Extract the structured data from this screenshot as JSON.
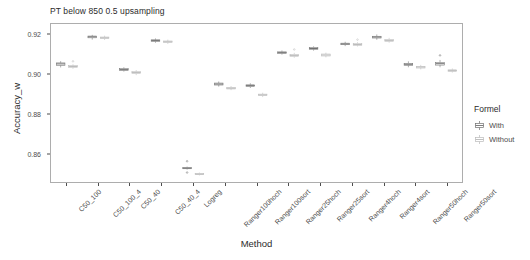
{
  "chart_data": {
    "type": "box",
    "title": "PT below 850 0.5 upsampling",
    "xlabel": "Method",
    "ylabel": "Accuracy_w",
    "ylim": [
      0.8455,
      0.9255
    ],
    "yticks": [
      0.86,
      0.88,
      0.9,
      0.92
    ],
    "ytick_labels": [
      "0.86",
      "0.88",
      "0.90",
      "0.92"
    ],
    "grid": false,
    "legend": {
      "title": "Formel",
      "position": "right",
      "entries": [
        {
          "label": "With",
          "color": "#6f6f6f"
        },
        {
          "label": "Without",
          "color": "#b9b9b9"
        }
      ]
    },
    "categories": [
      "C50_100",
      "C50_100_4",
      "C50_40",
      "C50_40_4",
      "Logreg",
      "Ranger100hoch",
      "Ranger100sort",
      "Ranger25hoch",
      "Ranger25sort",
      "Ranger4hoch",
      "Ranger4sort",
      "Ranger50hoch",
      "Ranger50sort"
    ],
    "series": [
      {
        "name": "With",
        "boxes": [
          {
            "min": 0.9035,
            "q1": 0.9046,
            "median": 0.9053,
            "q3": 0.9058,
            "max": 0.9067,
            "outliers": []
          },
          {
            "min": 0.9176,
            "q1": 0.9185,
            "median": 0.919,
            "q3": 0.9194,
            "max": 0.92,
            "outliers": []
          },
          {
            "min": 0.9014,
            "q1": 0.902,
            "median": 0.9024,
            "q3": 0.9029,
            "max": 0.9036,
            "outliers": []
          },
          {
            "min": 0.916,
            "q1": 0.9167,
            "median": 0.9171,
            "q3": 0.9175,
            "max": 0.9182,
            "outliers": []
          },
          {
            "min": 0.8518,
            "q1": 0.8522,
            "median": 0.8525,
            "q3": 0.8528,
            "max": 0.8533,
            "outliers": [
              0.856,
              0.8503
            ]
          },
          {
            "min": 0.8938,
            "q1": 0.8946,
            "median": 0.8951,
            "q3": 0.8956,
            "max": 0.8964,
            "outliers": []
          },
          {
            "min": 0.8931,
            "q1": 0.8938,
            "median": 0.8943,
            "q3": 0.8947,
            "max": 0.8955,
            "outliers": []
          },
          {
            "min": 0.91,
            "q1": 0.9106,
            "median": 0.911,
            "q3": 0.9114,
            "max": 0.9121,
            "outliers": []
          },
          {
            "min": 0.912,
            "q1": 0.9127,
            "median": 0.9131,
            "q3": 0.9136,
            "max": 0.9142,
            "outliers": []
          },
          {
            "min": 0.9143,
            "q1": 0.915,
            "median": 0.9154,
            "q3": 0.9158,
            "max": 0.9165,
            "outliers": []
          },
          {
            "min": 0.9175,
            "q1": 0.9184,
            "median": 0.9189,
            "q3": 0.9193,
            "max": 0.9202,
            "outliers": []
          },
          {
            "min": 0.9036,
            "q1": 0.9046,
            "median": 0.9051,
            "q3": 0.9056,
            "max": 0.9066,
            "outliers": []
          },
          {
            "min": 0.9036,
            "q1": 0.9047,
            "median": 0.9054,
            "q3": 0.906,
            "max": 0.9073,
            "outliers": [
              0.9096
            ]
          }
        ]
      },
      {
        "name": "Without",
        "boxes": [
          {
            "min": 0.9028,
            "q1": 0.9035,
            "median": 0.904,
            "q3": 0.9044,
            "max": 0.9051,
            "outliers": [
              0.9066
            ]
          },
          {
            "min": 0.9174,
            "q1": 0.9181,
            "median": 0.9185,
            "q3": 0.9189,
            "max": 0.9196,
            "outliers": []
          },
          {
            "min": 0.8996,
            "q1": 0.9004,
            "median": 0.9009,
            "q3": 0.9014,
            "max": 0.9022,
            "outliers": []
          },
          {
            "min": 0.9154,
            "q1": 0.9161,
            "median": 0.9165,
            "q3": 0.9169,
            "max": 0.9176,
            "outliers": []
          },
          {
            "min": 0.8488,
            "q1": 0.8492,
            "median": 0.8495,
            "q3": 0.8498,
            "max": 0.8503,
            "outliers": []
          },
          {
            "min": 0.892,
            "q1": 0.8926,
            "median": 0.893,
            "q3": 0.8934,
            "max": 0.8941,
            "outliers": []
          },
          {
            "min": 0.8885,
            "q1": 0.8892,
            "median": 0.8896,
            "q3": 0.89,
            "max": 0.8907,
            "outliers": []
          },
          {
            "min": 0.9084,
            "q1": 0.9091,
            "median": 0.9096,
            "q3": 0.9101,
            "max": 0.9109,
            "outliers": [
              0.9126
            ]
          },
          {
            "min": 0.9086,
            "q1": 0.9093,
            "median": 0.9098,
            "q3": 0.9103,
            "max": 0.911,
            "outliers": []
          },
          {
            "min": 0.9141,
            "q1": 0.9147,
            "median": 0.9151,
            "q3": 0.9156,
            "max": 0.9163,
            "outliers": [
              0.9176
            ]
          },
          {
            "min": 0.916,
            "q1": 0.9167,
            "median": 0.9172,
            "q3": 0.9177,
            "max": 0.9185,
            "outliers": []
          },
          {
            "min": 0.9025,
            "q1": 0.9032,
            "median": 0.9037,
            "q3": 0.9041,
            "max": 0.9048,
            "outliers": []
          },
          {
            "min": 0.9009,
            "q1": 0.9015,
            "median": 0.9019,
            "q3": 0.9023,
            "max": 0.903,
            "outliers": []
          }
        ]
      }
    ]
  }
}
